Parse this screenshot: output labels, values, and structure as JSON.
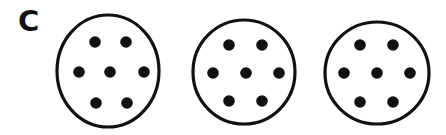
{
  "figure": {
    "panel_label": "C",
    "background_color": "#ffffff",
    "stroke_color": "#111111",
    "dot_color": "#111111",
    "width": 446,
    "height": 135,
    "description_type": "dot-pattern-stimulus",
    "circle_count": 3,
    "dots_per_circle": 7,
    "dot_arrangement": "hexagonal: 2 top, 3 middle, 2 bottom"
  },
  "circles": [
    {
      "name": "circle-1",
      "cx": 108,
      "cy": 71,
      "rx": 51,
      "ry": 56,
      "stroke_width": 3.2,
      "dot_radius": 5.8,
      "dots": [
        {
          "name": "dot-top-left",
          "cx": 95,
          "cy": 42
        },
        {
          "name": "dot-top-right",
          "cx": 126,
          "cy": 42
        },
        {
          "name": "dot-middle-left",
          "cx": 79,
          "cy": 72
        },
        {
          "name": "dot-middle-center",
          "cx": 110,
          "cy": 72
        },
        {
          "name": "dot-middle-right",
          "cx": 144,
          "cy": 72
        },
        {
          "name": "dot-bottom-left",
          "cx": 96,
          "cy": 103
        },
        {
          "name": "dot-bottom-right",
          "cx": 127,
          "cy": 103
        }
      ]
    },
    {
      "name": "circle-2",
      "cx": 244,
      "cy": 72,
      "rx": 51,
      "ry": 52,
      "stroke_width": 3.2,
      "dot_radius": 5.8,
      "dots": [
        {
          "name": "dot-top-left",
          "cx": 229,
          "cy": 45
        },
        {
          "name": "dot-top-right",
          "cx": 262,
          "cy": 45
        },
        {
          "name": "dot-middle-left",
          "cx": 213,
          "cy": 73
        },
        {
          "name": "dot-middle-center",
          "cx": 246,
          "cy": 73
        },
        {
          "name": "dot-middle-right",
          "cx": 279,
          "cy": 73
        },
        {
          "name": "dot-bottom-left",
          "cx": 229,
          "cy": 101
        },
        {
          "name": "dot-bottom-right",
          "cx": 262,
          "cy": 101
        }
      ]
    },
    {
      "name": "circle-3",
      "cx": 377,
      "cy": 73,
      "rx": 52,
      "ry": 51,
      "stroke_width": 3.2,
      "dot_radius": 5.8,
      "dots": [
        {
          "name": "dot-top-left",
          "cx": 360,
          "cy": 45
        },
        {
          "name": "dot-top-right",
          "cx": 393,
          "cy": 45
        },
        {
          "name": "dot-middle-left",
          "cx": 344,
          "cy": 73
        },
        {
          "name": "dot-middle-center",
          "cx": 377,
          "cy": 73
        },
        {
          "name": "dot-middle-right",
          "cx": 410,
          "cy": 73
        },
        {
          "name": "dot-bottom-left",
          "cx": 360,
          "cy": 102
        },
        {
          "name": "dot-bottom-right",
          "cx": 393,
          "cy": 102
        }
      ]
    }
  ]
}
